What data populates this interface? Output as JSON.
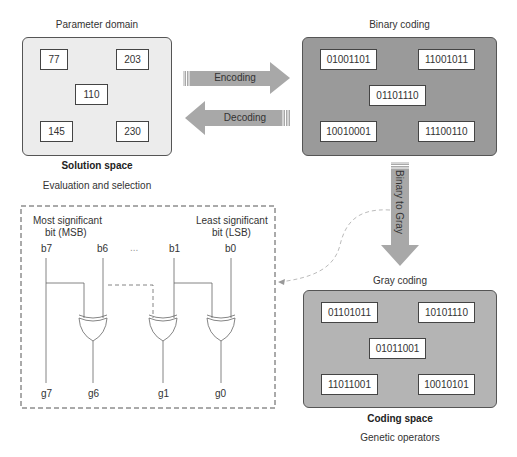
{
  "solution_space": {
    "title": "Parameter domain",
    "caption": "Solution space",
    "subcaption": "Evaluation and selection",
    "values": [
      "77",
      "203",
      "110",
      "145",
      "230"
    ]
  },
  "binary_space": {
    "title": "Binary coding",
    "values": [
      "01001101",
      "11001011",
      "01101110",
      "10010001",
      "11100110"
    ]
  },
  "gray_space": {
    "title": "Gray coding",
    "caption": "Coding space",
    "subcaption": "Genetic operators",
    "values": [
      "01101011",
      "10101110",
      "01011001",
      "11011001",
      "10010101"
    ]
  },
  "arrows": {
    "encoding": "Encoding",
    "decoding": "Decoding",
    "binary_to_gray": "Binary to Gray"
  },
  "circuit": {
    "msb_label_line1": "Most significant",
    "msb_label_line2": "bit (MSB)",
    "lsb_label_line1": "Least significant",
    "lsb_label_line2": "bit (LSB)",
    "inputs": [
      "b7",
      "b6",
      "b1",
      "b0"
    ],
    "ellipsis": "...",
    "outputs": [
      "g7",
      "g6",
      "g1",
      "g0"
    ]
  },
  "colors": {
    "solution_bg": "#ececec",
    "binary_bg": "#9a9a9a",
    "gray_bg": "#b4b4b4",
    "arrow_fill": "#a8a8a8"
  }
}
